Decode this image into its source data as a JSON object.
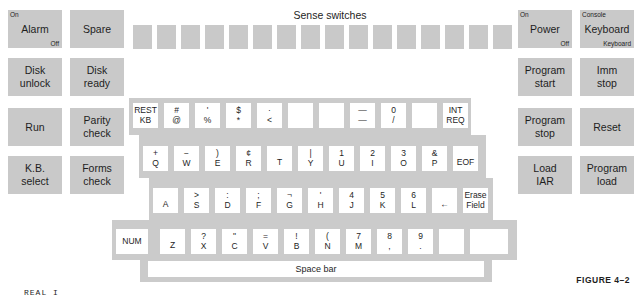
{
  "left_panel": [
    {
      "label": "Alarm",
      "top_left": "On",
      "bottom_right": "Off"
    },
    {
      "label": "Spare"
    },
    {
      "label": "Disk\nunlock"
    },
    {
      "label": "Disk\nready"
    },
    {
      "label": "Run"
    },
    {
      "label": "Parity\ncheck"
    },
    {
      "label": "K.B.\nselect"
    },
    {
      "label": "Forms\ncheck"
    }
  ],
  "sense_switches": {
    "title": "Sense switches",
    "count": 16
  },
  "right_panel": [
    {
      "label": "Power",
      "top_left": "On",
      "bottom_right": "Off"
    },
    {
      "label": "Keyboard",
      "top_left": "Console",
      "bottom_right": "Keyboard"
    },
    {
      "label": "Program\nstart"
    },
    {
      "label": "Imm\nstop"
    },
    {
      "label": "Program\nstop"
    },
    {
      "label": "Reset"
    },
    {
      "label": "Load\nIAR"
    },
    {
      "label": "Program\nload"
    }
  ],
  "keyboard": {
    "row1": [
      {
        "up": "REST",
        "down": "KB"
      },
      {
        "up": "#",
        "down": "@"
      },
      {
        "up": "'",
        "down": "%"
      },
      {
        "up": "$",
        "down": "*"
      },
      {
        "up": "·",
        "down": "<"
      },
      {
        "up": "",
        "down": ""
      },
      {
        "up": "",
        "down": ""
      },
      {
        "up": "—",
        "down": "—"
      },
      {
        "up": "0",
        "down": "/"
      },
      {
        "up": "",
        "down": ""
      },
      {
        "up": "INT",
        "down": "REQ"
      }
    ],
    "row2": [
      {
        "up": "+",
        "down": "Q"
      },
      {
        "up": "−",
        "down": "W"
      },
      {
        "up": ")",
        "down": "E"
      },
      {
        "up": "¢",
        "down": "R"
      },
      {
        "up": "",
        "down": "T"
      },
      {
        "up": "|",
        "down": "Y"
      },
      {
        "up": "1",
        "down": "U"
      },
      {
        "up": "2",
        "down": "I"
      },
      {
        "up": "3",
        "down": "O"
      },
      {
        "up": "&",
        "down": "P"
      },
      {
        "up": "",
        "down": "EOF"
      }
    ],
    "row3": [
      {
        "up": "",
        "down": "A"
      },
      {
        "up": ">",
        "down": "S"
      },
      {
        "up": ":",
        "down": "D"
      },
      {
        "up": ";",
        "down": "F"
      },
      {
        "up": "¬",
        "down": "G"
      },
      {
        "up": "'",
        "down": "H"
      },
      {
        "up": "4",
        "down": "J"
      },
      {
        "up": "5",
        "down": "K"
      },
      {
        "up": "6",
        "down": "L"
      },
      {
        "up": "",
        "down": "←"
      },
      {
        "up": "Erase",
        "down": "Field"
      }
    ],
    "row4": [
      {
        "up": "",
        "down": "NUM"
      },
      {
        "up": "",
        "down": "Z"
      },
      {
        "up": "?",
        "down": "X"
      },
      {
        "up": "\"",
        "down": "C"
      },
      {
        "up": "=",
        "down": "V"
      },
      {
        "up": "!",
        "down": "B"
      },
      {
        "up": "(",
        "down": "N"
      },
      {
        "up": "7",
        "down": "M"
      },
      {
        "up": "8",
        "down": ","
      },
      {
        "up": "9",
        "down": "."
      },
      {
        "up": "",
        "down": ""
      },
      {
        "up": "",
        "down": ""
      }
    ],
    "space_bar": "Space bar"
  },
  "caption": "FIGURE 4–2",
  "footer_text": "REAL I",
  "colors": {
    "panel_gray": "#c9c9c9",
    "keyboard_gray": "#cbcbcb",
    "key_white": "#ffffff",
    "text": "#1e1e1e"
  }
}
